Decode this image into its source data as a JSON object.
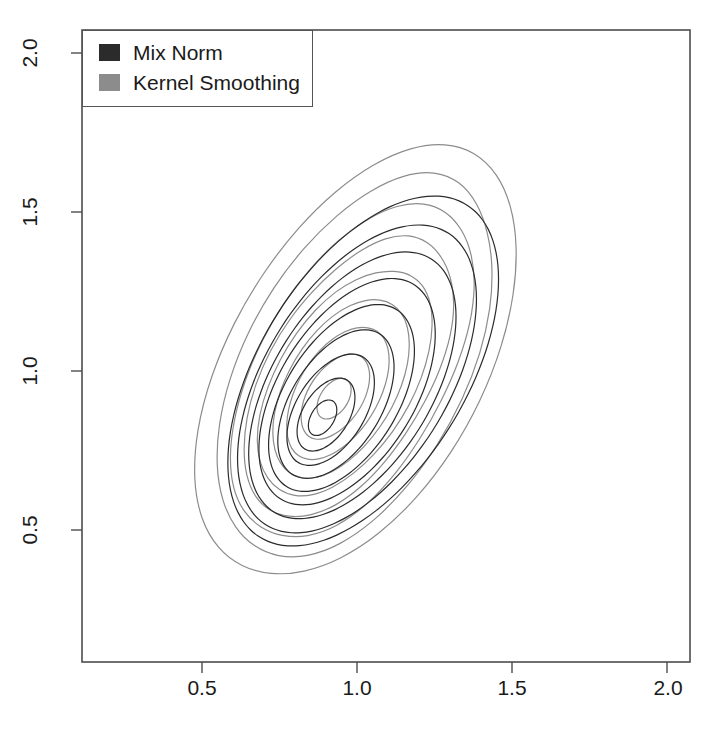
{
  "figure": {
    "width": 717,
    "height": 737,
    "background": "#ffffff"
  },
  "legend": {
    "position": "top-left",
    "border_color": "#555555",
    "entries": [
      {
        "label": "Mix Norm",
        "color": "#2b2b2b",
        "swatch": "filled-square"
      },
      {
        "label": "Kernel Smoothing",
        "color": "#8c8c8c",
        "swatch": "filled-square"
      }
    ]
  },
  "axes": {
    "x_ticks": [
      "0.5",
      "1.0",
      "1.5",
      "2.0"
    ],
    "y_ticks": [
      "0.5",
      "1.0",
      "1.5",
      "2.0"
    ],
    "xlabel": "",
    "ylabel": "",
    "frame_color": "#4d4d4d"
  },
  "chart_data": {
    "type": "line",
    "plot_kind": "contour",
    "title": "",
    "xlabel": "",
    "ylabel": "",
    "xlim": [
      0.18,
      2.07
    ],
    "ylim": [
      0.09,
      2.06
    ],
    "xticks": [
      0.5,
      1.0,
      1.5,
      2.0
    ],
    "yticks": [
      0.5,
      1.0,
      1.5,
      2.0
    ],
    "grid": false,
    "legend_position": "upper left",
    "axis_pixels": {
      "x_0p5": 202,
      "x_1p0": 357,
      "x_1p5": 512,
      "x_2p0": 668,
      "y_0p5": 530,
      "y_1p0": 371,
      "y_1p5": 212,
      "y_2p0": 53,
      "frame_left": 82,
      "frame_right": 690,
      "frame_top": 30,
      "frame_bottom": 662
    },
    "series": [
      {
        "name": "Mix Norm",
        "color": "#2b2b2b",
        "style": "smooth-ellipse",
        "linewidth": 1.2,
        "mode_center": [
          0.89,
          0.855
        ],
        "orientation_deg": 57,
        "contours": [
          {
            "level": 0.1,
            "center": [
              1.02,
              1.0
            ],
            "semi_major": 0.62,
            "semi_minor": 0.33,
            "angle_deg": 57
          },
          {
            "level": 0.2,
            "center": [
              1.0,
              0.975
            ],
            "semi_major": 0.545,
            "semi_minor": 0.293,
            "angle_deg": 57
          },
          {
            "level": 0.3,
            "center": [
              0.985,
              0.955
            ],
            "semi_major": 0.472,
            "semi_minor": 0.255,
            "angle_deg": 57
          },
          {
            "level": 0.4,
            "center": [
              0.968,
              0.935
            ],
            "semi_major": 0.4,
            "semi_minor": 0.218,
            "angle_deg": 57
          },
          {
            "level": 0.5,
            "center": [
              0.95,
              0.915
            ],
            "semi_major": 0.33,
            "semi_minor": 0.181,
            "angle_deg": 57
          },
          {
            "level": 0.6,
            "center": [
              0.932,
              0.896
            ],
            "semi_major": 0.262,
            "semi_minor": 0.145,
            "angle_deg": 57
          },
          {
            "level": 0.7,
            "center": [
              0.915,
              0.878
            ],
            "semi_major": 0.196,
            "semi_minor": 0.11,
            "angle_deg": 57
          },
          {
            "level": 0.8,
            "center": [
              0.9,
              0.863
            ],
            "semi_major": 0.128,
            "semi_minor": 0.074,
            "angle_deg": 57
          },
          {
            "level": 0.9,
            "center": [
              0.889,
              0.853
            ],
            "semi_major": 0.062,
            "semi_minor": 0.037,
            "angle_deg": 57
          }
        ]
      },
      {
        "name": "Kernel Smoothing",
        "color": "#8c8c8c",
        "style": "irregular-polygonal",
        "linewidth": 1.2,
        "mode_center": [
          0.93,
          0.93
        ],
        "orientation_deg": 60,
        "contours": [
          {
            "level": 0.1,
            "center": [
              1.0,
              1.03
            ],
            "semi_major": 0.76,
            "semi_minor": 0.4,
            "angle_deg": 60,
            "wobble": 0.045
          },
          {
            "level": 0.2,
            "center": [
              0.995,
              1.015
            ],
            "semi_major": 0.665,
            "semi_minor": 0.35,
            "angle_deg": 60,
            "wobble": 0.04
          },
          {
            "level": 0.3,
            "center": [
              0.985,
              1.0
            ],
            "semi_major": 0.575,
            "semi_minor": 0.303,
            "angle_deg": 59,
            "wobble": 0.036
          },
          {
            "level": 0.4,
            "center": [
              0.972,
              0.982
            ],
            "semi_major": 0.487,
            "semi_minor": 0.258,
            "angle_deg": 59,
            "wobble": 0.032
          },
          {
            "level": 0.5,
            "center": [
              0.96,
              0.963
            ],
            "semi_major": 0.4,
            "semi_minor": 0.214,
            "angle_deg": 58,
            "wobble": 0.028
          },
          {
            "level": 0.6,
            "center": [
              0.948,
              0.945
            ],
            "semi_major": 0.315,
            "semi_minor": 0.171,
            "angle_deg": 58,
            "wobble": 0.024
          },
          {
            "level": 0.7,
            "center": [
              0.938,
              0.93
            ],
            "semi_major": 0.232,
            "semi_minor": 0.129,
            "angle_deg": 57,
            "wobble": 0.02
          },
          {
            "level": 0.8,
            "center": [
              0.93,
              0.92
            ],
            "semi_major": 0.15,
            "semi_minor": 0.087,
            "angle_deg": 56,
            "wobble": 0.016
          },
          {
            "level": 0.9,
            "center": [
              0.926,
              0.913
            ],
            "semi_major": 0.072,
            "semi_minor": 0.044,
            "angle_deg": 55,
            "wobble": 0.012
          }
        ]
      }
    ]
  }
}
